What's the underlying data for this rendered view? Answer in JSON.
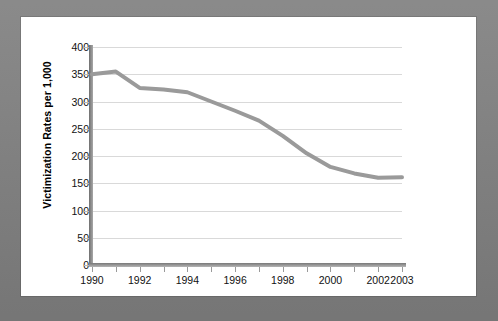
{
  "chart_data": {
    "type": "line",
    "title": "",
    "xlabel": "",
    "ylabel": "Victimization Rates per 1,000",
    "x": [
      1990,
      1991,
      1992,
      1993,
      1994,
      1995,
      1996,
      1997,
      1998,
      1999,
      2000,
      2001,
      2002,
      2003
    ],
    "values": [
      350,
      355,
      325,
      322,
      317,
      300,
      283,
      265,
      237,
      205,
      180,
      168,
      160,
      161
    ],
    "series": [
      {
        "name": "Victimization rate",
        "values": [
          350,
          355,
          325,
          322,
          317,
          300,
          283,
          265,
          237,
          205,
          180,
          168,
          160,
          161
        ]
      }
    ],
    "xlim": [
      1990,
      2003
    ],
    "ylim": [
      0,
      400
    ],
    "ytick_labels": [
      "400",
      "350",
      "300",
      "250",
      "200",
      "150",
      "100",
      "50",
      "0"
    ],
    "ytick_values": [
      400,
      350,
      300,
      250,
      200,
      150,
      100,
      50,
      0
    ],
    "xtick_values": [
      1990,
      1991,
      1992,
      1993,
      1994,
      1995,
      1996,
      1997,
      1998,
      1999,
      2000,
      2001,
      2002,
      2003
    ],
    "xtick_labels": [
      "1990",
      "",
      "1992",
      "",
      "1994",
      "",
      "1996",
      "",
      "1998",
      "",
      "2000",
      "",
      "2002",
      "2003"
    ],
    "grid": true,
    "grid_axis": "y",
    "legend": false,
    "legend_position": "none",
    "line_color": "#9a9a9a",
    "line_width": 4,
    "markers": false,
    "axis_color": "#8a8a8a",
    "grid_color": "#d9d9d9",
    "plot_background": "#ffffff",
    "border_color": "#7d7d7d"
  }
}
